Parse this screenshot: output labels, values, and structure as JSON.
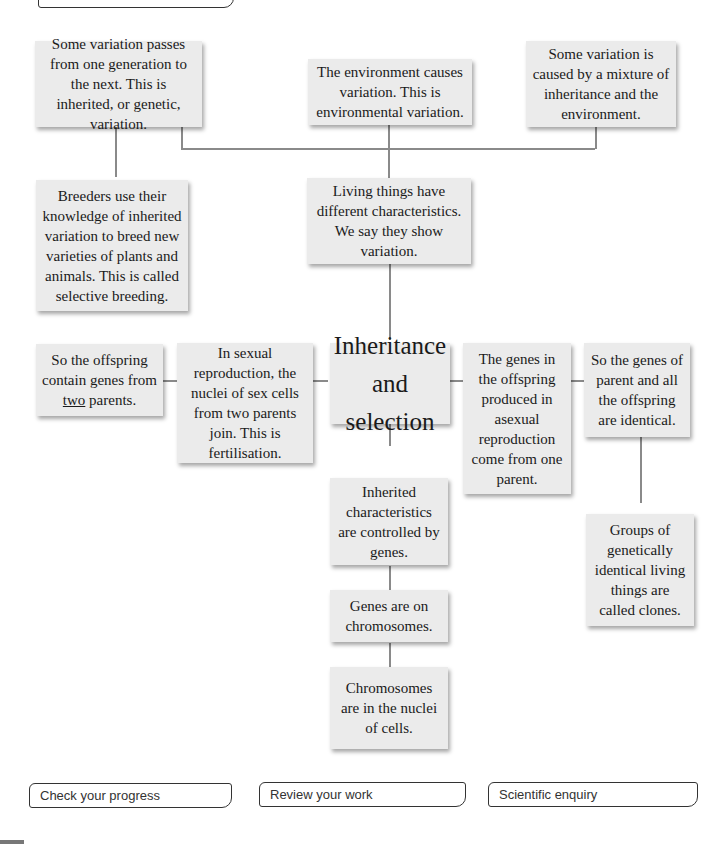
{
  "diagram": {
    "center": {
      "label_lines": [
        "Inheritance",
        "and",
        "selection"
      ]
    },
    "boxes": {
      "inherited_variation": "Some variation passes from one generation to the next. This is inherited, or genetic, variation.",
      "environmental_variation": "The environment causes variation. This is environmental variation.",
      "mixture_variation": "Some variation is caused by a mixture of inheritance and the environment.",
      "selective_breeding": "Breeders use their knowledge of inherited variation to breed new varieties of plants and animals. This is called selective breeding.",
      "living_things": "Living things have different characteristics. We say they show variation.",
      "offspring_two_parents_pre": "So the offspring contain genes from ",
      "offspring_two_parents_underlined": "two",
      "offspring_two_parents_post": " parents.",
      "sexual_reproduction": "In sexual reproduction, the nuclei of sex cells from two parents join. This is fertilisation.",
      "asexual_genes": "The genes in the offspring produced in asexual reproduction come from one parent.",
      "identical_genes": "So the genes of parent and all the offspring are identical.",
      "clones": "Groups of genetically identical living things are called clones.",
      "controlled_by_genes": "Inherited characteristics are controlled by genes.",
      "genes_on_chromosomes": "Genes are on chromosomes.",
      "chromosomes_in_nuclei": "Chromosomes are in the nuclei of cells."
    }
  },
  "footer_tabs": {
    "check_progress": "Check your progress",
    "review_work": "Review your work",
    "scientific_enquiry": "Scientific enquiry"
  },
  "colors": {
    "box_fill": "#ebebeb",
    "connector": "#8a8a8a",
    "tab_border": "#333333"
  }
}
